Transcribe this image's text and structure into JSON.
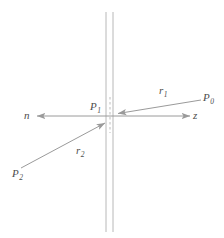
{
  "figure": {
    "title": "",
    "colors": {
      "line": "#9a9a9a",
      "interface_line": "#b8b8b8",
      "dashed_line": "#bdbdbd",
      "label_text": "#4d4d4d",
      "background": "#ffffff"
    },
    "labels": {
      "p0": {
        "base": "P",
        "sub": "0"
      },
      "p1": {
        "base": "P",
        "sub": "1"
      },
      "p2": {
        "base": "P",
        "sub": "2"
      },
      "r1": {
        "base": "r",
        "sub": "1"
      },
      "r2": {
        "base": "r",
        "sub": "2"
      },
      "n": {
        "base": "n",
        "sub": ""
      },
      "z": {
        "base": "z",
        "sub": ""
      }
    },
    "geometry": {
      "interface_line_1_x": 106,
      "interface_line_2_x": 113,
      "interface_top_y": 12,
      "interface_bottom_y": 232,
      "dashed_segment": {
        "x": 110,
        "y1": 98,
        "y2": 132
      },
      "axis_y": 116,
      "axis_left_x": 35,
      "axis_right_x": 192,
      "ray_r1": {
        "from_x": 201,
        "from_y": 100,
        "to_x": 117,
        "to_y": 114
      },
      "ray_r2": {
        "from_x": 21,
        "from_y": 168,
        "to_x": 106,
        "to_y": 123
      }
    }
  }
}
